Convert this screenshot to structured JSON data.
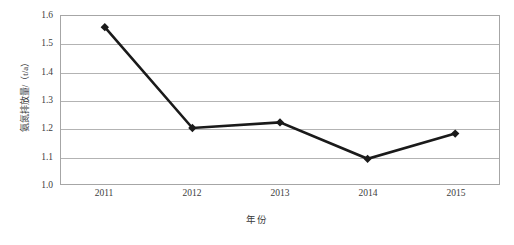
{
  "chart_data": {
    "type": "line",
    "title": "",
    "subtitle": "",
    "xlabel": "年份",
    "ylabel": "氨氮排放量/（t/a）",
    "categories": [
      "2011",
      "2012",
      "2013",
      "2014",
      "2015"
    ],
    "x": [
      2011,
      2012,
      2013,
      2014,
      2015
    ],
    "values": [
      1.56,
      1.2,
      1.22,
      1.09,
      1.18
    ],
    "series": [
      {
        "name": "氨氮排放量",
        "values": [
          1.56,
          1.2,
          1.22,
          1.09,
          1.18
        ],
        "color": "#1a1a1a",
        "marker": "diamond",
        "line_width": 2.6
      }
    ],
    "ylim": [
      1.0,
      1.6
    ],
    "ytick_labels": [
      "1.0",
      "1.1",
      "1.2",
      "1.3",
      "1.4",
      "1.5",
      "1.6"
    ],
    "ytick_values": [
      1.0,
      1.1,
      1.2,
      1.3,
      1.4,
      1.5,
      1.6
    ],
    "xtick_labels": [
      "2011",
      "2012",
      "2013",
      "2014",
      "2015"
    ],
    "grid": {
      "horizontal": true,
      "vertical": false,
      "color": "#b3b3b3"
    },
    "legend": {
      "visible": false,
      "position": "none",
      "entries": []
    },
    "annotations": [],
    "plot_border_color": "#a6a6a6",
    "background_color": "#ffffff"
  }
}
